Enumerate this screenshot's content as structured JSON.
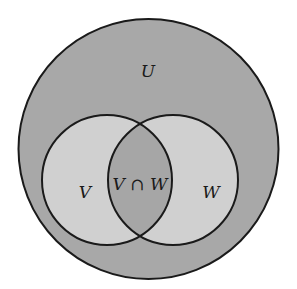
{
  "diagram": {
    "type": "venn",
    "colors": {
      "background": "#ffffff",
      "universe_fill": "#a8a8a8",
      "set_fill": "#d0d0d0",
      "intersection_fill": "#a6a6a6",
      "stroke": "#1a1a1a"
    },
    "universe": {
      "label": "U",
      "cx": 148.5,
      "cy": 149,
      "r": 130
    },
    "sets": [
      {
        "label": "V",
        "cx": 107,
        "cy": 180,
        "r": 65
      },
      {
        "label": "W",
        "cx": 173,
        "cy": 180,
        "r": 65
      }
    ],
    "intersection": {
      "label": "V ∩ W"
    }
  }
}
